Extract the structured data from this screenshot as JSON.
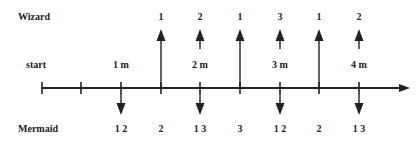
{
  "rows": {
    "wizard_label": "Wizard",
    "start_label": "start",
    "mermaid_label": "Mermaid"
  },
  "axis": {
    "y": 88,
    "x_start": 42,
    "x_end": 410,
    "ticks": [
      42,
      81,
      121,
      161,
      200,
      240,
      280,
      319,
      359
    ],
    "color": "#222222"
  },
  "distances": [
    {
      "label": "1 m",
      "x": 121
    },
    {
      "label": "2 m",
      "x": 200
    },
    {
      "label": "3 m",
      "x": 280
    },
    {
      "label": "4 m",
      "x": 359
    }
  ],
  "wizard_arrows": [
    {
      "x": 161,
      "type": "long",
      "label": "1"
    },
    {
      "x": 200,
      "type": "short",
      "label": "2"
    },
    {
      "x": 240,
      "type": "long",
      "label": "1"
    },
    {
      "x": 280,
      "type": "short",
      "label": "3"
    },
    {
      "x": 319,
      "type": "long",
      "label": "1"
    },
    {
      "x": 359,
      "type": "short",
      "label": "2"
    }
  ],
  "mermaid_arrows": [
    {
      "x": 121
    },
    {
      "x": 200
    },
    {
      "x": 280
    },
    {
      "x": 359
    }
  ],
  "mermaid_labels": [
    {
      "x": 121,
      "label": "1 2"
    },
    {
      "x": 161,
      "label": "2"
    },
    {
      "x": 200,
      "label": "1 3"
    },
    {
      "x": 240,
      "label": "3"
    },
    {
      "x": 280,
      "label": "1 2"
    },
    {
      "x": 319,
      "label": "2"
    },
    {
      "x": 359,
      "label": "1 3"
    }
  ]
}
